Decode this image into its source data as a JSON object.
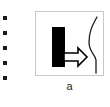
{
  "figure": {
    "caption": "a",
    "panel": {
      "border_color": "#c9c9c9",
      "background_color": "#ffffff",
      "elements": {
        "bar": {
          "name": "black-bar",
          "color": "#000000",
          "x": 16,
          "y": 15,
          "width": 13,
          "height": 40
        },
        "arrow": {
          "name": "right-arrow",
          "direction": "right",
          "style": "outlined",
          "stroke_color": "#000000",
          "fill_color": "#ffffff"
        },
        "curve": {
          "name": "s-curve",
          "stroke_color": "#1a1a1a",
          "shape": "sigmoid"
        }
      }
    }
  },
  "bullets": {
    "color": "#1a1a1a",
    "count": 5,
    "items": [
      {
        "label": "",
        "y": 16
      },
      {
        "label": "",
        "y": 31
      },
      {
        "label": "",
        "y": 46
      },
      {
        "label": "",
        "y": 61
      },
      {
        "label": "",
        "y": 76
      }
    ]
  }
}
